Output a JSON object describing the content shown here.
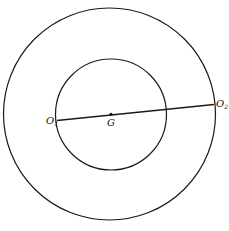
{
  "diagram": {
    "outer_circle": {
      "cx": 109.5,
      "cy": 114,
      "r": 106
    },
    "inner_circle": {
      "cx": 111,
      "cy": 114.5,
      "r": 55.5
    },
    "line": {
      "x1": 57,
      "y1": 120.5,
      "x2": 214,
      "y2": 104.5
    },
    "point_g": {
      "cx": 111,
      "cy": 114.3
    },
    "labels": {
      "o1": {
        "main": "O",
        "sub": "1"
      },
      "g": "G",
      "o2": {
        "main": "O",
        "sub": "2"
      }
    },
    "stroke_color": "#1a1a1a"
  }
}
